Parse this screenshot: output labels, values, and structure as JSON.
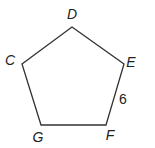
{
  "diagram": {
    "type": "regular-pentagon",
    "vertices": [
      {
        "label": "D",
        "x": 72,
        "y": 27,
        "lx": 72,
        "ly": 19
      },
      {
        "label": "E",
        "x": 124,
        "y": 64,
        "lx": 131,
        "ly": 67
      },
      {
        "label": "F",
        "x": 106,
        "y": 125,
        "lx": 110,
        "ly": 140
      },
      {
        "label": "G",
        "x": 41,
        "y": 125,
        "lx": 38,
        "ly": 142
      },
      {
        "label": "C",
        "x": 22,
        "y": 64,
        "lx": 10,
        "ly": 65
      }
    ],
    "side_label": {
      "text": "6",
      "side": "EF",
      "x": 123,
      "y": 104
    },
    "stroke_color": "#333333"
  }
}
